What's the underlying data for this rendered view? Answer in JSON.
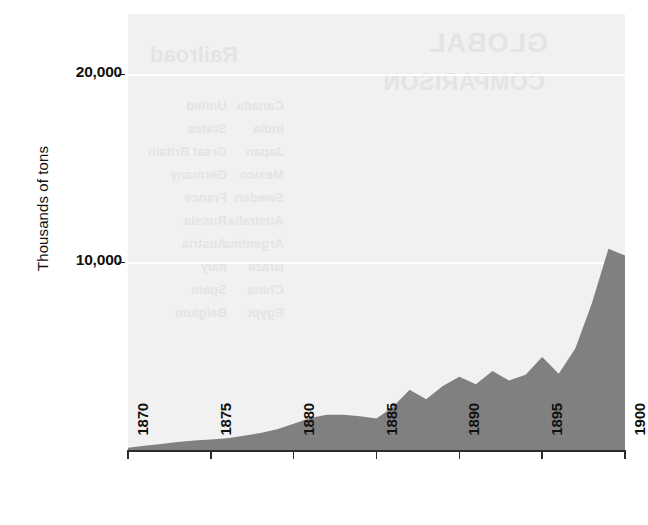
{
  "chart_data": {
    "type": "area",
    "title": "",
    "subtitle": "",
    "xlabel": "",
    "ylabel": "Thousands of tons",
    "xlim": [
      1870,
      1900
    ],
    "ylim": [
      0,
      23500
    ],
    "grid": true,
    "legend": null,
    "series_name": "Tonnage",
    "fill_color": "#808080",
    "panel_color": "#f1f1f1",
    "gridline_color": "#ffffff",
    "x": [
      1870,
      1871,
      1872,
      1873,
      1874,
      1875,
      1876,
      1877,
      1878,
      1879,
      1880,
      1881,
      1882,
      1883,
      1884,
      1885,
      1886,
      1887,
      1888,
      1889,
      1890,
      1891,
      1892,
      1893,
      1894,
      1895,
      1896,
      1897,
      1898,
      1899,
      1900
    ],
    "values": [
      120,
      220,
      320,
      420,
      500,
      560,
      620,
      760,
      900,
      1100,
      1400,
      1700,
      1880,
      1870,
      1800,
      1680,
      2300,
      3200,
      2700,
      3400,
      3900,
      3500,
      4200,
      3700,
      4000,
      4950,
      4050,
      5400,
      7800,
      10700,
      10350
    ],
    "x_ticks": [
      1870,
      1875,
      1880,
      1885,
      1890,
      1895,
      1900
    ],
    "x_tick_labels": [
      "1870",
      "1875",
      "1880",
      "1885",
      "1890",
      "1895",
      "1900"
    ],
    "y_ticks": [
      10000,
      20000
    ],
    "y_tick_labels": [
      "10,000",
      "20,000"
    ],
    "show_through_text": {
      "heading_primary": "GLOBAL",
      "heading_secondary": "COMPARISON",
      "heading_left": "Railroad",
      "column_left": "United\nStates\nGreat Britain\nGermany\nFrance\nRussia\nAustria\nItaly\nSpain\nBelgium",
      "column_right": "Canada\nIndia\nJapan\nMexico\nSweden\nAustralia\nArgentina\nBrazil\nChina\nEgypt"
    }
  },
  "geometry": {
    "plot_left": 128,
    "plot_top": 14,
    "plot_width": 497,
    "plot_height": 436,
    "baseline_y": 450,
    "y_pixel_per_unit": 0.01876,
    "x_pixel_per_year": 16.566
  }
}
